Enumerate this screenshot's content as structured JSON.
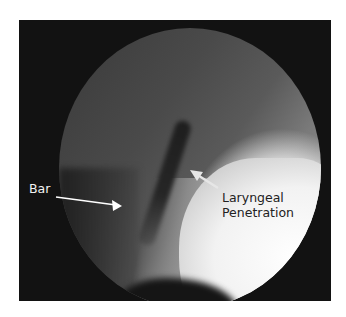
{
  "figure": {
    "annotations": [
      {
        "label": "Bar",
        "text_color": "#f2f2f2",
        "arrow_color": "#ffffff"
      },
      {
        "label_line1": "Laryngeal",
        "label_line2": "Penetration",
        "text_color": "#222222",
        "arrow_color": "#e8e8e8"
      }
    ]
  }
}
